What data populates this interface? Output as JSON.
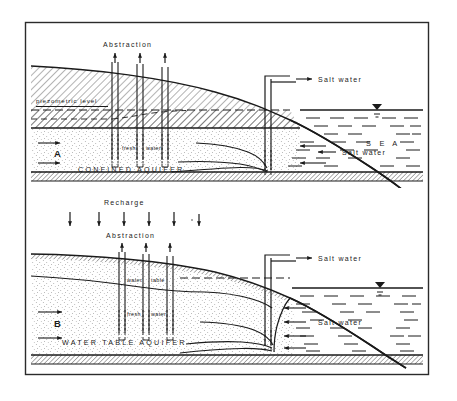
{
  "figure": {
    "background_color": "#ffffff",
    "ink_color": "#1a1a1a",
    "frame": {
      "x": 25,
      "y": 22,
      "width": 404,
      "height": 353
    }
  },
  "panels": [
    {
      "id": "A",
      "panel_label": "A",
      "aquifer_label": "CONFINED  AQUIFER",
      "abstraction_label": "Abstraction",
      "abstraction_arrow_count": 3,
      "recharge_label": null,
      "recharge_arrow_count": 0,
      "piezometric_label": "piezometric level",
      "water_table_label": null,
      "fresh_water_label_left": "fresh",
      "fresh_water_label_right": "water",
      "salt_water_label_top": "Salt  water",
      "salt_water_label_bottom": "Salt  water",
      "sea_label": "S E A",
      "wells": [
        {
          "x": 115,
          "label": null
        },
        {
          "x": 140,
          "label": null
        },
        {
          "x": 165,
          "label": null
        }
      ],
      "coast_well_x": 268
    },
    {
      "id": "B",
      "panel_label": "B",
      "aquifer_label": "WATER  TABLE  AQUIFER",
      "abstraction_label": "Abstraction",
      "abstraction_arrow_count": 3,
      "recharge_label": "Recharge",
      "recharge_arrow_count": 6,
      "piezometric_label": null,
      "water_table_label_left": "water",
      "water_table_label_right": "table",
      "fresh_water_label_left": "fresh",
      "fresh_water_label_right": "water",
      "salt_water_label_top": "Salt  water",
      "salt_water_label_bottom": "Salt  water",
      "sea_label": null,
      "wells": [
        {
          "x": 122,
          "label": null
        },
        {
          "x": 146,
          "label": null
        },
        {
          "x": 170,
          "label": null
        }
      ],
      "coast_well_x": 268
    }
  ],
  "legend_terms": {
    "abstraction": "Abstraction",
    "recharge": "Recharge",
    "piezometric_level": "piezometric level",
    "water_table": "water table",
    "fresh_water": "fresh water",
    "salt_water": "Salt  water",
    "sea": "S E A",
    "confined_aquifer": "CONFINED  AQUIFER",
    "water_table_aquifer": "WATER  TABLE  AQUIFER"
  }
}
